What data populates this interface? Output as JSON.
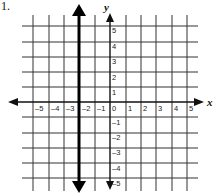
{
  "problem_number": "1.",
  "graph": {
    "x_axis_label": "x",
    "y_axis_label": "y",
    "x_ticks": [
      "–5",
      "–4",
      "–3",
      "–2",
      "–1",
      "0",
      "1",
      "2",
      "3",
      "4",
      "5"
    ],
    "y_ticks_pos": [
      "5",
      "4",
      "3",
      "2",
      "1"
    ],
    "y_ticks_neg": [
      "–1",
      "–2",
      "–3",
      "–4",
      "–5"
    ],
    "range": {
      "x": [
        -5,
        5
      ],
      "y": [
        -5,
        5
      ]
    },
    "grid": true,
    "drawn_line": {
      "type": "vertical",
      "x": -2.5,
      "description": "bold vertical line with arrows at both ends"
    },
    "colors": {
      "grid": "#222222",
      "background": "#ffffff"
    }
  }
}
